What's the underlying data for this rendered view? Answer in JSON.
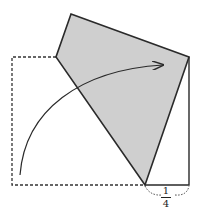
{
  "diagram": {
    "fraction_label": {
      "numerator": "1",
      "denominator": "4"
    },
    "colors": {
      "shade": "#cfcfcf",
      "stroke": "#2a2a2a"
    }
  }
}
